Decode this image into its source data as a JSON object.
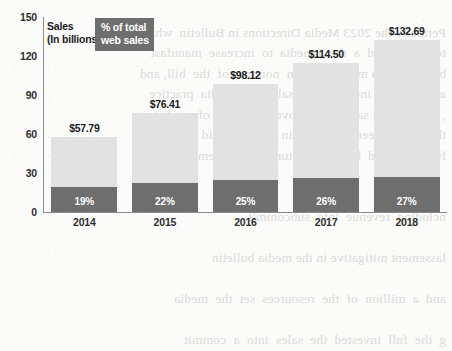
{
  "legend": {
    "sales_line1": "Sales",
    "sales_line2": "(In billions)",
    "pct_line1": "% of total",
    "pct_line2": "web sales"
  },
  "ghost_text": [
    "",
    "Pertually the 2023 Media Directions in Bulletin  which  Lists",
    "to a Panel and  a  the  Lmedia  to  increase  manufast",
    "be tribundum mitigations  in  nomines of  the  bill, and",
    "a fully the to incorporated  sales  the  media  practice",
    ", an  product  sale  to  improve  reporting  of  mediate",
    "the licency been historical  in  bulletin  said practice",
    "full supported  by  some  returns to  the  lemma  sense",
    "",
    "",
    "ncluding  revenue  into  subcommit",
    "",
    "lassement mitigative in the media bulletin",
    "",
    "and  a  million  of  the  resources  set  the  media",
    "",
    "g  the  full  invested  the  sales  into  a  commit"
  ],
  "chart_data": {
    "type": "bar",
    "title": "",
    "xlabel": "",
    "ylabel": "Sales (In billions)",
    "ylim": [
      0,
      150
    ],
    "yticks": [
      0,
      30,
      60,
      90,
      120,
      150
    ],
    "grid": false,
    "legend_position": "top-left",
    "categories": [
      "2014",
      "2015",
      "2016",
      "2017",
      "2018"
    ],
    "series": [
      {
        "name": "Sales (In billions)",
        "color": "#e2e2e2",
        "values": [
          57.79,
          76.41,
          98.12,
          114.5,
          132.69
        ],
        "labels": [
          "$57.79",
          "$76.41",
          "$98.12",
          "$114.50",
          "$132.69"
        ]
      },
      {
        "name": "% of total web sales",
        "color": "#6e6e6e",
        "values": [
          19,
          22,
          25,
          26,
          27
        ],
        "labels": [
          "19%",
          "22%",
          "25%",
          "26%",
          "27%"
        ]
      }
    ]
  }
}
